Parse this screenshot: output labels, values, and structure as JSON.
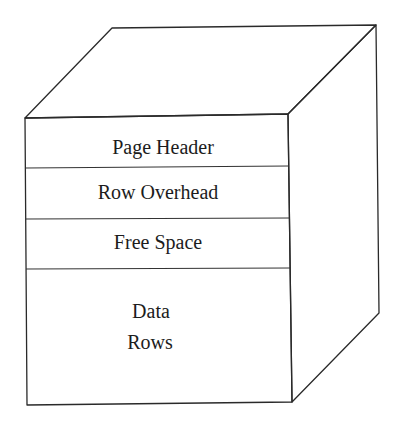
{
  "diagram": {
    "type": "3d-box-page-layout",
    "sections": [
      {
        "id": "page-header",
        "label": "Page Header"
      },
      {
        "id": "row-overhead",
        "label": "Row Overhead"
      },
      {
        "id": "free-space",
        "label": "Free Space"
      },
      {
        "id": "data-rows",
        "label_lines": [
          "Data",
          "Rows"
        ]
      }
    ],
    "colors": {
      "line": "#2a2a2a",
      "text": "#1c1c1c",
      "background": "#ffffff"
    }
  }
}
